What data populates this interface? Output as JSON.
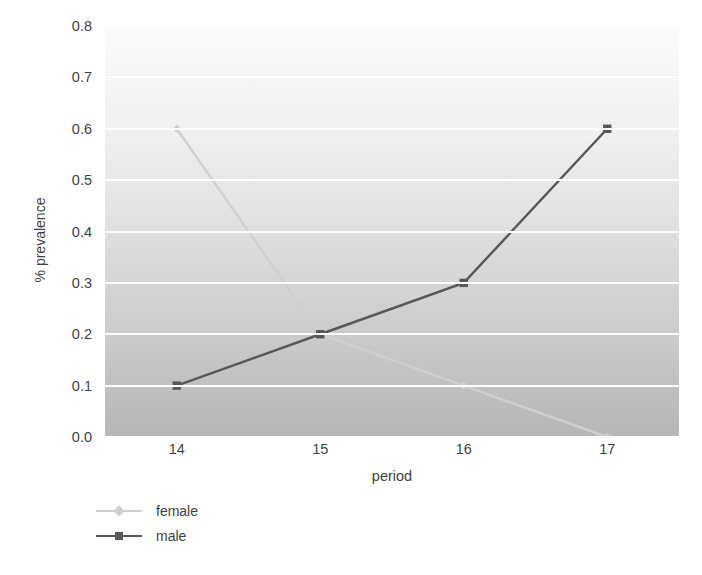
{
  "chart_data": {
    "type": "line",
    "title": "",
    "xlabel": "period",
    "ylabel": "% prevalence",
    "categories": [
      "14",
      "15",
      "16",
      "17"
    ],
    "x": [
      14,
      15,
      16,
      17
    ],
    "xlim": [
      13.5,
      17.5
    ],
    "ylim": [
      0.0,
      0.8
    ],
    "yticks": [
      "0.0",
      "0.1",
      "0.2",
      "0.3",
      "0.4",
      "0.5",
      "0.6",
      "0.7",
      "0.8"
    ],
    "ytick_values": [
      0.0,
      0.1,
      0.2,
      0.3,
      0.4,
      0.5,
      0.6,
      0.7,
      0.8
    ],
    "grid": "horizontal",
    "legend_position": "bottom-left",
    "series": [
      {
        "name": "female",
        "values": [
          0.6,
          0.2,
          0.1,
          0.0
        ],
        "color": "#cfcfcf",
        "marker": "diamond"
      },
      {
        "name": "male",
        "values": [
          0.1,
          0.2,
          0.3,
          0.6
        ],
        "color": "#575757",
        "marker": "square"
      }
    ]
  },
  "legend": {
    "items": [
      {
        "label": "female"
      },
      {
        "label": "male"
      }
    ]
  },
  "colors": {
    "female": "#cfcfcf",
    "male": "#575757",
    "gridline": "#ffffff",
    "text": "#3f3f3f",
    "plot_bg_top": "#fbfbfb",
    "plot_bg_bottom": "#b6b6b6"
  }
}
